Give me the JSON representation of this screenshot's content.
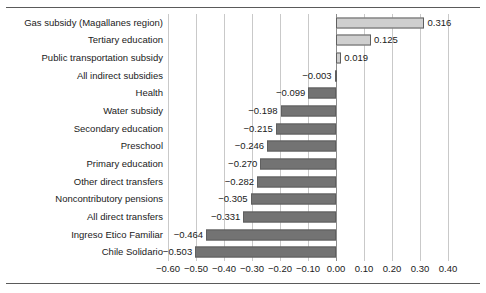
{
  "chart_data": {
    "type": "bar",
    "orientation": "horizontal",
    "title": "",
    "subtitle": "",
    "xlabel": "",
    "ylabel": "",
    "xlim": [
      -0.6,
      0.4
    ],
    "xtick_step": 0.1,
    "grid": true,
    "legend": null,
    "colors": {
      "positive_bar_fill": "#cfcfcf",
      "negative_bar_fill": "#737373",
      "bar_edge": "#5f5f5f",
      "gridline": "#c9c9c9",
      "zero_line": "#8c8c8c",
      "text": "#1a1a1a",
      "rule": "#5a5a5a"
    },
    "xticks": [
      "-0.60",
      "-0.50",
      "-0.40",
      "-0.30",
      "-0.20",
      "-0.10",
      "0.00",
      "0.10",
      "0.20",
      "0.30",
      "0.40"
    ],
    "categories": [
      "Gas subsidy (Magallanes region)",
      "Tertiary education",
      "Public transportation subsidy",
      "All indirect subsidies",
      "Health",
      "Water subsidy",
      "Secondary education",
      "Preschool",
      "Primary education",
      "Other direct transfers",
      "Noncontributory pensions",
      "All direct transfers",
      "Ingreso Etico Familiar",
      "Chile Solidario"
    ],
    "values": [
      0.316,
      0.125,
      0.019,
      -0.003,
      -0.099,
      -0.198,
      -0.215,
      -0.246,
      -0.27,
      -0.282,
      -0.305,
      -0.331,
      -0.464,
      -0.503
    ],
    "value_labels": [
      "0.316",
      "0.125",
      "0.019",
      "-0.003",
      "-0.099",
      "-0.198",
      "-0.215",
      "-0.246",
      "-0.270",
      "-0.282",
      "-0.305",
      "-0.331",
      "-0.464",
      "-0.503"
    ]
  }
}
